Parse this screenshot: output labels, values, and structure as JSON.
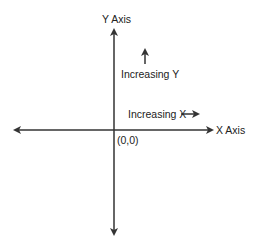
{
  "diagram": {
    "y_axis_label": "Y Axis",
    "x_axis_label": "X Axis",
    "origin_label": "(0,0)",
    "increasing_y_label": "Increasing Y",
    "increasing_x_label": "Increasing X",
    "line_color": "#333333"
  }
}
